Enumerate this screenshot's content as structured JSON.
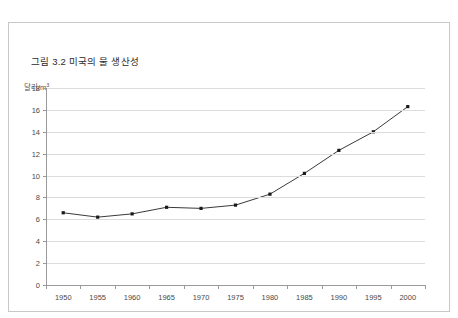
{
  "top_sliver_text": "· · · · · · · · · · · · · · · · · · · · · · ·",
  "figure": {
    "title": "그림 3.2 미국의 물 생산성",
    "unit_label_main": "달러/m",
    "unit_label_sup": "3"
  },
  "colors": {
    "line": "#3a3a3a",
    "marker": "#1a1a1a",
    "grid": "#dcdcdc",
    "axis": "#9a9a9a",
    "border": "#c8c8c8",
    "text": "#4a4a4a"
  },
  "chart_data": {
    "type": "line",
    "title": "그림 3.2 미국의 물 생산성",
    "xlabel": "",
    "ylabel": "달러/m3",
    "x": [
      1950,
      1955,
      1960,
      1965,
      1970,
      1975,
      1980,
      1985,
      1990,
      1995,
      2000
    ],
    "xtick_labels": [
      "1950",
      "1955",
      "1960",
      "1965",
      "1970",
      "1975",
      "1980",
      "1985",
      "1990",
      "1995",
      "2000"
    ],
    "values": [
      6.6,
      6.2,
      6.5,
      7.1,
      7.0,
      7.3,
      8.3,
      10.2,
      12.3,
      14.0,
      16.3
    ],
    "ytick_labels": [
      "0",
      "2",
      "4",
      "6",
      "8",
      "10",
      "12",
      "14",
      "16",
      "18"
    ],
    "yticks": [
      0,
      2,
      4,
      6,
      8,
      10,
      12,
      14,
      16,
      18
    ],
    "ylim": [
      0,
      18
    ],
    "xlim": [
      1947.5,
      2002.5
    ],
    "grid": "horizontal",
    "legend": "none",
    "markers": "square"
  }
}
